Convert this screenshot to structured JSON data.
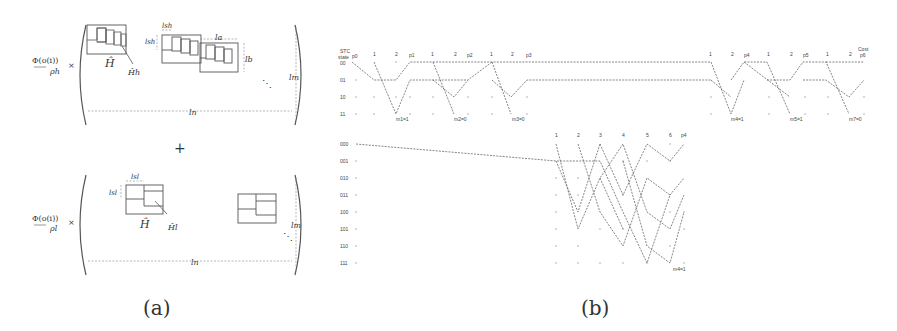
{
  "panel_a": {
    "caption": "(a)",
    "top_term": {
      "coefficient_num": "Φ(o(i))",
      "coefficient_den": "ρh",
      "times": "×",
      "block_label": "Ĥ",
      "sub_block_label": "Ĥh",
      "dim_labels": {
        "lsh_w": "lsh",
        "lsh_h": "lsh",
        "la": "la",
        "lb": "lb",
        "lm": "lm",
        "ln": "ln"
      },
      "ellipsis": "⋱"
    },
    "plus": "+",
    "bottom_term": {
      "coefficient_num": "Φ(o(i))",
      "coefficient_den": "ρl",
      "times": "×",
      "block_label": "Ĥ",
      "sub_block_label": "Ĥl",
      "dim_labels": {
        "lsl_w": "lsl",
        "lsl_h": "lsl",
        "lm": "lm",
        "ln": "ln"
      },
      "ellipsis": "⋱"
    }
  },
  "panel_b": {
    "caption": "(b)",
    "top_trellis": {
      "header_left": "STC",
      "header_left2": "state",
      "cost_label": "Cost",
      "states": [
        "00",
        "01",
        "10",
        "11"
      ],
      "column_labels": [
        "p0",
        "1",
        "2",
        "p1",
        "1",
        "2",
        "p2",
        "1",
        "2",
        "p3",
        "1",
        "2",
        "p4",
        "1",
        "2",
        "p5",
        "1",
        "2",
        "p6",
        "1",
        "2",
        "p7"
      ],
      "message_labels": [
        "m1=1",
        "m2=0",
        "m3=0",
        "m4=1",
        "m5=1",
        "m7=0"
      ]
    },
    "bottom_trellis": {
      "states": [
        "000",
        "001",
        "010",
        "011",
        "100",
        "101",
        "110",
        "111"
      ],
      "column_labels": [
        "1",
        "2",
        "3",
        "4",
        "5",
        "6",
        "p4"
      ],
      "message_label": "m4=1"
    }
  }
}
